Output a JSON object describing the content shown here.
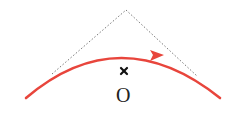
{
  "diagram": {
    "center_label": "O",
    "center_marker": "cross",
    "colors": {
      "arc": "#e8453c",
      "tangent_lines": "#777777",
      "marker": "#111111",
      "label": "#222222"
    },
    "elements": [
      {
        "type": "arc",
        "description": "red circular arc with direction arrow pointing right"
      },
      {
        "type": "tangent-lines",
        "description": "two dotted lines tangent to arc meeting at apex above"
      },
      {
        "type": "center-point",
        "label": "O"
      }
    ]
  }
}
